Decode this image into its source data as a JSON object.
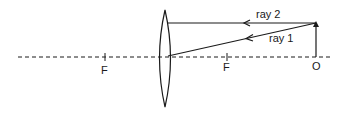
{
  "diagram": {
    "type": "converging lens ray diagram",
    "labels": {
      "focal_left": "F",
      "focal_right": "F",
      "object": "O",
      "ray1": "ray 1",
      "ray2": "ray 2"
    },
    "colors": {
      "stroke": "#1a1a1a",
      "background": "#ffffff"
    }
  }
}
